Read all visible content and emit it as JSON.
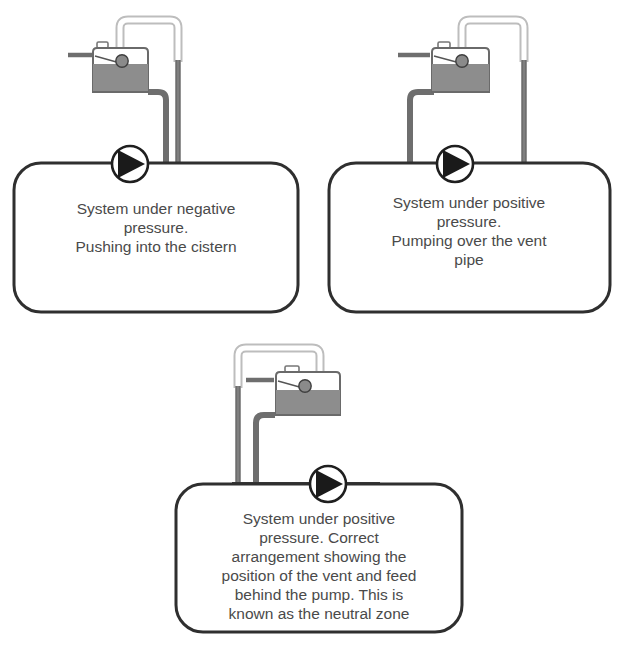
{
  "figure": {
    "background_color": "#ffffff",
    "palette": {
      "outline_dark": "#2f2f2f",
      "pipe_dark": "#6e6e6e",
      "pipe_light_stroke": "#bdbdbd",
      "pipe_light_fill": "#ffffff",
      "water_fill": "#8d8d8d",
      "cistern_body": "#ffffff",
      "cistern_outline": "#555555",
      "ball_float": "#8a8a8a",
      "ball_outline": "#4a4a4a",
      "pump_triangle": "#1a1a1a",
      "pump_circle_fill": "#ffffff",
      "text_color": "#4a4a4a"
    }
  },
  "panels": [
    {
      "id": "panel-negative-pressure",
      "index": 1,
      "mirrored": false,
      "caption_lines": [
        "System under negative",
        "pressure.",
        "Pushing into the cistern"
      ],
      "caption_full": "System under negative pressure. Pushing into the cistern",
      "components": [
        "cistern",
        "ball-float",
        "vent-pipe",
        "feed-pipe",
        "pump",
        "supply-inlet"
      ]
    },
    {
      "id": "panel-positive-pressure-vent",
      "index": 2,
      "mirrored": false,
      "caption_lines": [
        "System under positive",
        "pressure.",
        "Pumping over the vent",
        "pipe"
      ],
      "caption_full": "System under positive pressure. Pumping over the vent pipe",
      "components": [
        "cistern",
        "ball-float",
        "vent-pipe",
        "feed-pipe",
        "pump",
        "supply-inlet"
      ]
    },
    {
      "id": "panel-neutral-zone",
      "index": 3,
      "mirrored": true,
      "caption_lines": [
        "System under positive",
        "pressure. Correct",
        "arrangement showing the",
        "position of the vent and feed",
        "behind the pump. This is",
        "known as the neutral zone"
      ],
      "caption_full": "System under positive pressure. Correct arrangement showing the position of the vent and feed behind the pump. This is known as the neutral zone",
      "components": [
        "cistern",
        "ball-float",
        "vent-pipe",
        "feed-pipe",
        "pump",
        "supply-inlet"
      ]
    }
  ],
  "icons": {
    "pump": "pump-icon",
    "cistern": "cistern-icon",
    "ball_float": "ball-float-icon",
    "vent_pipe": "vent-pipe-icon",
    "feed_pipe": "feed-pipe-icon"
  }
}
